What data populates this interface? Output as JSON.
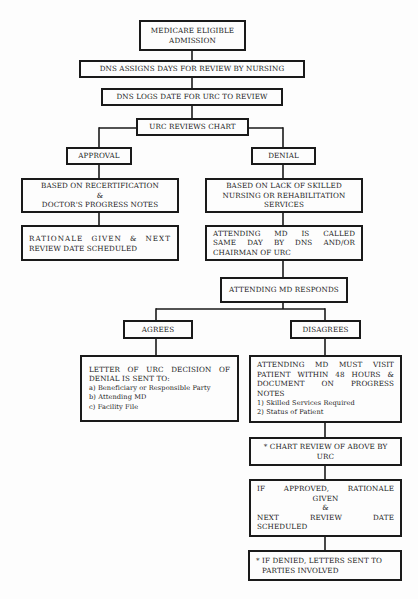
{
  "flowchart": {
    "nodes": {
      "medicare": [
        "MEDICARE ELIGIBLE",
        "ADMISSION"
      ],
      "dns_assigns": [
        "DNS ASSIGNS DAYS FOR REVIEW BY NURSING"
      ],
      "dns_logs": [
        "DNS LOGS DATE FOR URC TO REVIEW"
      ],
      "urc_reviews": [
        "URC REVIEWS CHART"
      ],
      "approval": [
        "APPROVAL"
      ],
      "denial": [
        "DENIAL"
      ],
      "based_recert": [
        "BASED ON RECERTIFICATION",
        "&",
        "DOCTOR'S PROGRESS NOTES"
      ],
      "based_lack": [
        "BASED ON LACK OF SKILLED",
        "NURSING OR REHABILITATION",
        "SERVICES"
      ],
      "rationale": [
        "RATIONALE GIVEN & NEXT",
        "REVIEW DATE SCHEDULED"
      ],
      "md_called": [
        "ATTENDING MD IS CALLED",
        "SAME DAY BY DNS AND/OR",
        "CHAIRMAN OF URC"
      ],
      "md_responds": [
        "ATTENDING MD RESPONDS"
      ],
      "agrees": [
        "AGREES"
      ],
      "disagrees": [
        "DISAGREES"
      ],
      "letter": {
        "heading": [
          "LETTER OF URC DECISION OF",
          "DENIAL IS SENT TO:"
        ],
        "items": [
          "a) Beneficiary or Responsible Party",
          "b) Attending MD",
          "c) Facility File"
        ]
      },
      "must_visit": {
        "heading": [
          "ATTENDING MD MUST VISIT",
          "PATIENT WITHIN 48 HOURS &",
          "DOCUMENT ON PROGRESS",
          "NOTES"
        ],
        "items": [
          "1) Skilled Services Required",
          "2) Status of Patient"
        ]
      },
      "chart_review": [
        "* CHART REVIEW OF ABOVE BY",
        "URC"
      ],
      "if_approved": [
        "IF APPROVED, RATIONALE",
        "GIVEN",
        "&",
        "NEXT REVIEW DATE",
        "SCHEDULED"
      ],
      "if_denied": [
        "* IF DENIED, LETTERS SENT TO",
        "PARTIES INVOLVED"
      ]
    }
  }
}
